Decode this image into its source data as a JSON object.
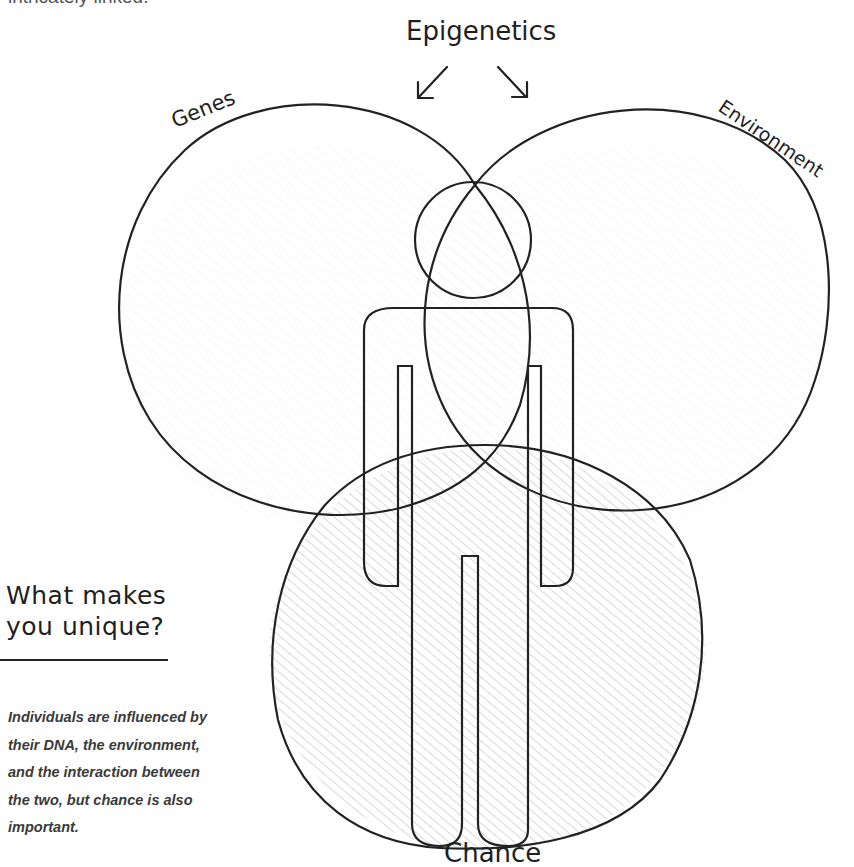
{
  "intro": {
    "text": "intricately linked."
  },
  "diagram": {
    "labels": {
      "top": "Epigenetics",
      "left": "Genes",
      "right": "Environment",
      "bottom": "Chance"
    },
    "arrows": [
      "arrow-down-left",
      "arrow-down-right"
    ],
    "circles": [
      "Genes",
      "Environment",
      "Chance"
    ],
    "center_figure": "person-silhouette",
    "colors": {
      "stroke": "#222222",
      "hatch": "#c8c8c8",
      "background": "#ffffff"
    }
  },
  "sidebar": {
    "title_line1": "What makes",
    "title_line2": "you unique?",
    "body": "Individuals are influenced by their DNA, the environment, and the interaction between the two, but chance is also important."
  }
}
